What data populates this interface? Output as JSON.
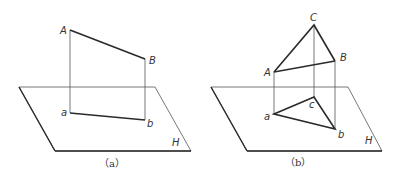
{
  "figures": [
    {
      "caption": "（a）",
      "plane_label": "H",
      "points_upper": {
        "A": "A",
        "B": "B"
      },
      "points_lower": {
        "a": "a",
        "b": "b"
      }
    },
    {
      "caption": "（b）",
      "plane_label": "H",
      "points_upper": {
        "A": "A",
        "B": "B",
        "C": "C"
      },
      "points_lower": {
        "a": "a",
        "b": "b",
        "c": "c"
      }
    }
  ],
  "colors": {
    "stroke": "#2a2a2a",
    "thin": "#555555"
  }
}
